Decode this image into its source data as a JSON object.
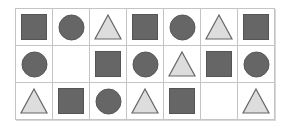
{
  "colors": {
    "square": "#666666",
    "circle": "#666666",
    "triangle_fill": "#dddddd",
    "triangle_stroke": "#666666",
    "grid_line": "#c4c4c4"
  },
  "grid": {
    "rows": 3,
    "cols": 7,
    "cells": [
      [
        "square",
        "circle",
        "triangle",
        "square",
        "circle",
        "triangle",
        "square"
      ],
      [
        "circle",
        "empty",
        "square",
        "circle",
        "triangle",
        "square",
        "circle"
      ],
      [
        "triangle",
        "square",
        "circle",
        "triangle",
        "square",
        "empty",
        "triangle"
      ]
    ]
  }
}
